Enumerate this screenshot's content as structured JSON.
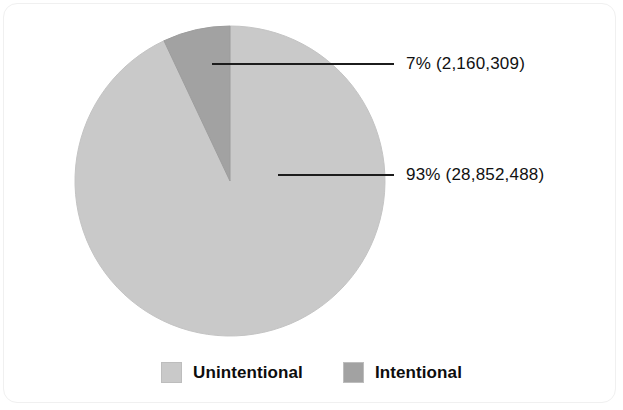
{
  "chart_data": {
    "type": "pie",
    "title": "",
    "subtitle": "",
    "xlabel": "",
    "ylabel": "",
    "legend_position": "bottom",
    "grid": false,
    "categories": [
      "Unintentional",
      "Intentional"
    ],
    "values": [
      93,
      7
    ],
    "counts": [
      28852488,
      2160309
    ],
    "slices": [
      {
        "label": "Unintentional",
        "percent": 93,
        "percent_text": "93%",
        "count": 28852488,
        "count_text": "(28,852,488)",
        "callout_text": "93% (28,852,488)",
        "color": "#c9c9c9"
      },
      {
        "label": "Intentional",
        "percent": 7,
        "percent_text": "7%",
        "count": 2160309,
        "count_text": "(2,160,309)",
        "callout_text": "7% (2,160,309)",
        "color": "#a2a2a2"
      }
    ],
    "annotations": [
      "7% (2,160,309)",
      "93% (28,852,488)"
    ]
  },
  "legend": {
    "items": [
      {
        "label": "Unintentional",
        "color": "#c9c9c9"
      },
      {
        "label": "Intentional",
        "color": "#a2a2a2"
      }
    ]
  },
  "colors": {
    "unintentional": "#c9c9c9",
    "intentional": "#a2a2a2",
    "leader_line": "#1c1c1c",
    "text": "#111111",
    "background": "#ffffff"
  }
}
